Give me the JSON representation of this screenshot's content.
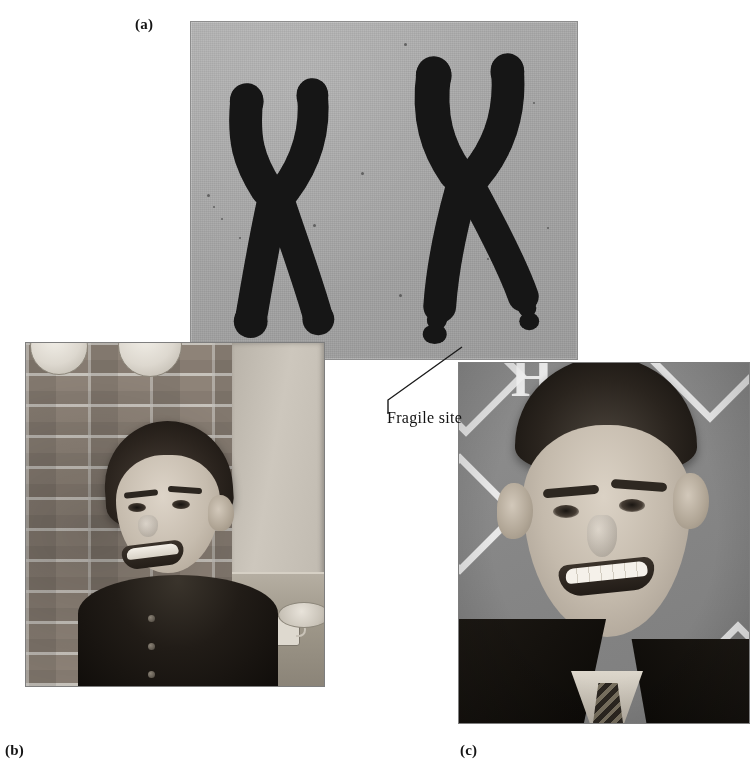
{
  "figure": {
    "labels": {
      "a": "(a)",
      "b": "(b)",
      "c": "(c)"
    },
    "annotation": {
      "fragile_site": "Fragile site"
    }
  },
  "panel_a": {
    "name": "karyotype-photograph",
    "description": "Photomicrograph of two X chromosomes on a gray background",
    "background_color": "#a8a8a8",
    "chromosome_color": "#151515",
    "chromosomes": [
      {
        "id": "normal-x-chromosome",
        "label": "normal X chromosome",
        "position": "left",
        "has_fragile_site": false
      },
      {
        "id": "fragile-x-chromosome",
        "label": "fragile X chromosome",
        "position": "right",
        "has_fragile_site": true,
        "fragile_site_count": 2
      }
    ]
  },
  "panel_b": {
    "name": "boy-photograph",
    "description": "Young boy with fragile X syndrome smiling in front of a brick wall",
    "subject": "young boy",
    "setting": "brick wall with decorative plates and mugs"
  },
  "panel_c": {
    "name": "young-man-photograph",
    "description": "Young man with fragile X syndrome smiling, wearing a dark suit and tie",
    "subject": "young man",
    "setting": "patterned backdrop with diamonds and lettering",
    "backdrop_letters": [
      "PY"
    ]
  },
  "colors": {
    "page_background": "#ffffff",
    "text": "#121212",
    "leader_line": "#1b1b1b",
    "panel_a_background": "#a8a8a8"
  }
}
